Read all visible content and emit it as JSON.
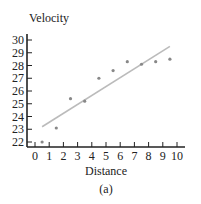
{
  "chart_data": {
    "type": "scatter",
    "title": "",
    "xlabel": "Distance",
    "ylabel": "Velocity",
    "caption": "(a)",
    "x_ticks": [
      "0",
      "1",
      "2",
      "3",
      "4",
      "5",
      "6",
      "7",
      "8",
      "9",
      "10"
    ],
    "y_ticks": [
      "22",
      "23",
      "24",
      "25",
      "26",
      "27",
      "28",
      "29",
      "30"
    ],
    "xlim": [
      0,
      10
    ],
    "ylim": [
      22,
      30
    ],
    "grid": false,
    "points": [
      {
        "x": 0.5,
        "y": 22.0
      },
      {
        "x": 1.5,
        "y": 23.1
      },
      {
        "x": 2.5,
        "y": 25.4
      },
      {
        "x": 3.5,
        "y": 25.2
      },
      {
        "x": 4.5,
        "y": 27.0
      },
      {
        "x": 5.5,
        "y": 27.6
      },
      {
        "x": 6.5,
        "y": 28.3
      },
      {
        "x": 7.5,
        "y": 28.1
      },
      {
        "x": 8.5,
        "y": 28.3
      },
      {
        "x": 9.5,
        "y": 28.5
      }
    ],
    "fit_line": {
      "x1": 0.5,
      "y1": 23.2,
      "x2": 9.5,
      "y2": 29.5
    },
    "colors": {
      "axis": "#222222",
      "points": "#888888",
      "line": "#bbbbbb"
    }
  }
}
